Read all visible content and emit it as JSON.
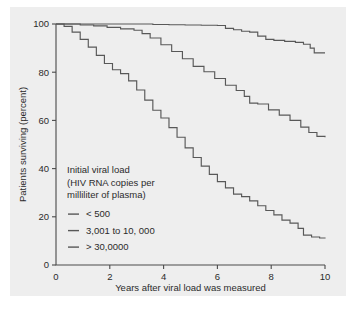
{
  "chart_data": {
    "type": "line",
    "title": "",
    "xlabel": "Years after viral load was measured",
    "ylabel": "Patients surviving (percent)",
    "xlim": [
      0,
      10
    ],
    "ylim": [
      0,
      100
    ],
    "xticks": [
      "0",
      "2",
      "4",
      "6",
      "8",
      "10"
    ],
    "yticks": [
      "0",
      "20",
      "40",
      "60",
      "80",
      "100"
    ],
    "grid": false,
    "legend_position": "inside-lower-left",
    "legend_title_lines": [
      "Initial viral load",
      "(HIV RNA copies per",
      "milliliter of plasma)"
    ],
    "series": [
      {
        "name": "< 500",
        "color": "#585858",
        "x": [
          0,
          0.6,
          1.2,
          1.9,
          2.5,
          3.1,
          3.6,
          4.2,
          4.8,
          5.4,
          6.0,
          6.3,
          6.6,
          6.9,
          7.2,
          7.5,
          7.8,
          8.1,
          8.5,
          8.9,
          9.2,
          9.45,
          9.6,
          10
        ],
        "y": [
          100,
          100,
          100,
          100,
          100,
          100,
          99.8,
          99.7,
          99.6,
          99.5,
          99.4,
          98.2,
          97.6,
          97.0,
          96.6,
          95.0,
          93.6,
          93.2,
          92.8,
          92.4,
          91.6,
          90.0,
          88.0,
          88.0
        ]
      },
      {
        "name": "3,001 to 10, 000",
        "color": "#585858",
        "x": [
          0,
          0.4,
          0.9,
          1.4,
          1.9,
          2.4,
          2.9,
          3.2,
          3.5,
          3.9,
          4.3,
          4.7,
          5.1,
          5.5,
          5.9,
          6.3,
          6.7,
          7.0,
          7.2,
          7.5,
          7.9,
          8.3,
          8.7,
          9.1,
          9.4,
          9.7,
          10
        ],
        "y": [
          100,
          100,
          99.6,
          99.2,
          98.6,
          98.0,
          97.4,
          96.0,
          94.2,
          91.4,
          88.6,
          85.6,
          82.4,
          80.2,
          77.4,
          74.6,
          72.4,
          70.0,
          67.2,
          66.8,
          64.4,
          62.2,
          60.0,
          57.2,
          55.0,
          53.4,
          53.0
        ]
      },
      {
        "name": "> 30,0000",
        "color": "#585858",
        "x": [
          0,
          0.3,
          0.6,
          0.9,
          1.2,
          1.5,
          1.8,
          2.1,
          2.4,
          2.7,
          3.0,
          3.3,
          3.6,
          3.9,
          4.2,
          4.5,
          4.8,
          5.1,
          5.4,
          5.7,
          6.0,
          6.3,
          6.6,
          6.9,
          7.2,
          7.5,
          7.8,
          8.1,
          8.4,
          8.7,
          9.0,
          9.2,
          9.5,
          9.8,
          10
        ],
        "y": [
          100,
          99.0,
          96.6,
          93.6,
          90.4,
          87.0,
          83.6,
          81.0,
          79.4,
          76.4,
          72.6,
          68.4,
          64.2,
          61.0,
          57.0,
          53.0,
          48.6,
          44.6,
          41.0,
          37.6,
          34.6,
          32.0,
          29.4,
          28.4,
          26.6,
          24.6,
          22.6,
          20.8,
          18.6,
          17.4,
          15.2,
          12.4,
          11.6,
          11.2,
          11.0
        ]
      }
    ]
  }
}
